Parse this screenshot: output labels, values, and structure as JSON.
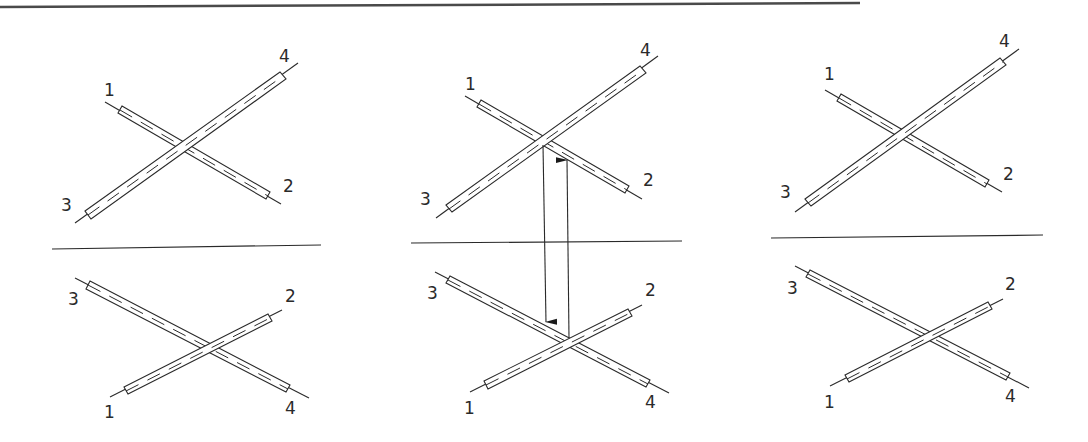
{
  "figure": {
    "panels": [
      {
        "id": "left",
        "top": {
          "labels": {
            "1": "1",
            "2": "2",
            "3": "3",
            "4": "4"
          }
        },
        "bottom": {
          "labels": {
            "1": "1",
            "2": "2",
            "3": "3",
            "4": "4"
          }
        }
      },
      {
        "id": "middle",
        "top": {
          "labels": {
            "1": "1",
            "2": "2",
            "3": "3",
            "4": "4"
          }
        },
        "bottom": {
          "labels": {
            "1": "1",
            "2": "2",
            "3": "3",
            "4": "4"
          }
        },
        "arrows": [
          "down-arrow-from-top-crossing-to-bottom-rod-3-4",
          "up-arrow-from-bottom-crossing-to-top-rod-1-2"
        ]
      },
      {
        "id": "right",
        "top": {
          "labels": {
            "1": "1",
            "2": "2",
            "3": "3",
            "4": "4"
          }
        },
        "bottom": {
          "labels": {
            "1": "1",
            "2": "2",
            "3": "3",
            "4": "4"
          }
        }
      }
    ],
    "colors": {
      "line": "#2a2a2a",
      "background": "#ffffff",
      "top_border": "#4a4a4a"
    }
  }
}
